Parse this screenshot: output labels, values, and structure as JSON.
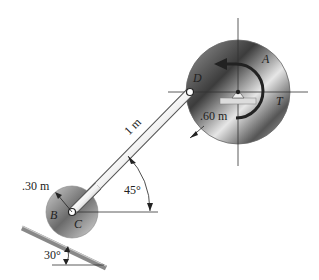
{
  "diagram": {
    "type": "mechanism",
    "labels": {
      "disk_a": "A",
      "disk_b": "B",
      "pin_c": "C",
      "pin_d": "D",
      "torque": "T",
      "rod_length": "1 m",
      "radius_a": ".60 m",
      "radius_b": ".30 m",
      "rod_angle": "45°",
      "incline_angle": "30°"
    },
    "colors": {
      "disk_dark": "#333333",
      "disk_light": "#e8e8e8",
      "rod": "#9a9a9a",
      "line": "#333333"
    }
  }
}
